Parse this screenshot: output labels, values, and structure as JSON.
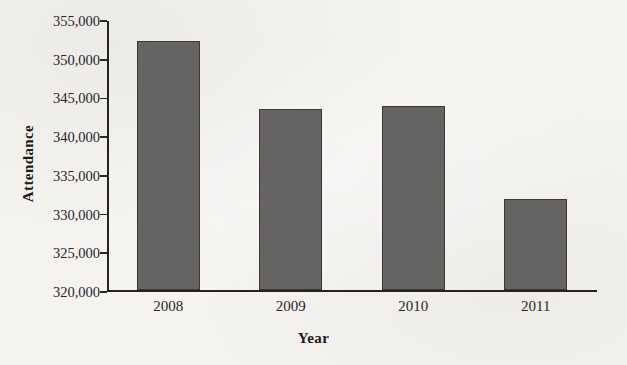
{
  "chart_data": {
    "type": "bar",
    "title": "",
    "xlabel": "Year",
    "ylabel": "Attendance",
    "categories": [
      "2008",
      "2009",
      "2010",
      "2011"
    ],
    "values": [
      352200,
      343400,
      343800,
      331800
    ],
    "ylim": [
      320000,
      355000
    ],
    "ytick_step": 5000,
    "yticks": [
      320000,
      325000,
      330000,
      335000,
      340000,
      345000,
      350000,
      355000
    ],
    "ytick_labels": [
      "320,000",
      "325,000",
      "330,000",
      "335,000",
      "340,000",
      "345,000",
      "350,000",
      "355,000"
    ],
    "grid": false,
    "legend": null,
    "bar_color": "#666463",
    "bar_border_color": "#3b3837",
    "axis_color": "#262221",
    "background_color": "#f4f3f0"
  }
}
